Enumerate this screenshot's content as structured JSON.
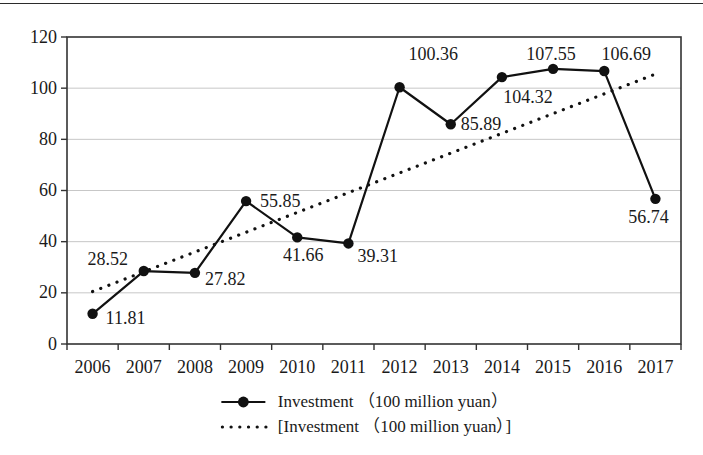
{
  "page": {
    "background": "#ffffff",
    "top_rule_color": "#2b2b2b"
  },
  "chart_data": {
    "type": "line",
    "title": "",
    "xlabel": "",
    "ylabel": "",
    "categories": [
      "2006",
      "2007",
      "2008",
      "2009",
      "2010",
      "2011",
      "2012",
      "2013",
      "2014",
      "2015",
      "2016",
      "2017"
    ],
    "series": [
      {
        "name": "Investment （100 million yuan）",
        "style": "solid-line-filled-circle-markers",
        "color": "#111111",
        "values": [
          11.81,
          28.52,
          27.82,
          55.85,
          41.66,
          39.31,
          100.36,
          85.89,
          104.32,
          107.55,
          106.69,
          56.74
        ],
        "data_labels": [
          "11.81",
          "28.52",
          "27.82",
          "55.85",
          "41.66",
          "39.31",
          "100.36",
          "85.89",
          "104.32",
          "107.55",
          "106.69",
          "56.74"
        ]
      },
      {
        "name": "[Investment （100 million yuan）]",
        "style": "dotted-linear-trendline",
        "color": "#111111",
        "endpoint_values": [
          20.5,
          105.5
        ]
      }
    ],
    "ylim": [
      0,
      120
    ],
    "yticks": [
      0,
      20,
      40,
      60,
      80,
      100,
      120
    ],
    "grid": "horizontal",
    "legend_position": "bottom-center",
    "colors": {
      "text": "#1a1a1a",
      "grid": "#c7c7c7",
      "axis": "#333333",
      "series": "#111111"
    },
    "label_placements": [
      {
        "anchor": "start",
        "dx": 13,
        "dy": 10
      },
      {
        "anchor": "middle",
        "dx": -36,
        "dy": -6
      },
      {
        "anchor": "start",
        "dx": 10,
        "dy": 12
      },
      {
        "anchor": "start",
        "dx": 14,
        "dy": 6
      },
      {
        "anchor": "middle",
        "dx": 6,
        "dy": 24
      },
      {
        "anchor": "start",
        "dx": 9,
        "dy": 19
      },
      {
        "anchor": "start",
        "dx": 9,
        "dy": -27
      },
      {
        "anchor": "start",
        "dx": 10,
        "dy": 6
      },
      {
        "anchor": "middle",
        "dx": 26,
        "dy": 26
      },
      {
        "anchor": "middle",
        "dx": -2,
        "dy": -9
      },
      {
        "anchor": "middle",
        "dx": 22,
        "dy": -11
      },
      {
        "anchor": "middle",
        "dx": -7,
        "dy": 24
      }
    ]
  }
}
